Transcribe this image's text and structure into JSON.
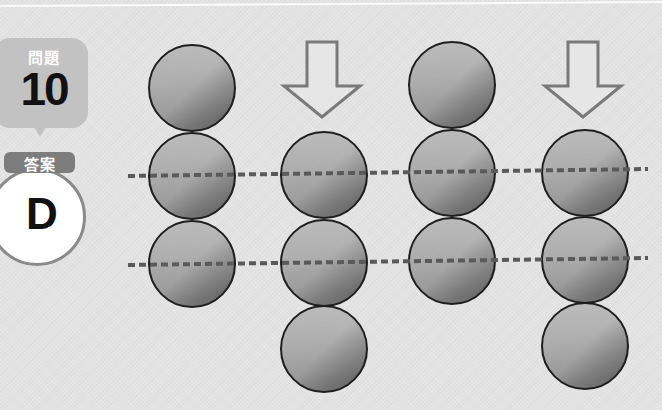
{
  "question": {
    "label": "問題",
    "number": "10"
  },
  "answer": {
    "label": "答案",
    "value": "D"
  },
  "diagram": {
    "columns": [
      {
        "index": 1,
        "arrow": false,
        "spheres_y": [
          88,
          176,
          264
        ],
        "x": 192
      },
      {
        "index": 2,
        "arrow": true,
        "spheres_y": [
          175,
          263,
          349
        ],
        "x": 324
      },
      {
        "index": 3,
        "arrow": false,
        "spheres_y": [
          85,
          173,
          261
        ],
        "x": 452
      },
      {
        "index": 4,
        "arrow": true,
        "spheres_y": [
          173,
          260,
          346
        ],
        "x": 585
      }
    ],
    "sphere_radius": 43,
    "dashed_lines": [
      {
        "x1": 128,
        "y1": 176,
        "x2": 648,
        "y2": 169
      },
      {
        "x1": 128,
        "y1": 265,
        "x2": 648,
        "y2": 258
      }
    ],
    "colors": {
      "background": "#e3e3e3",
      "sphere_light": "#b9b9b9",
      "sphere_dark": "#6f6f6f",
      "sphere_outline": "#1e1e1e",
      "dash": "#5a5a5a",
      "arrow_stroke": "#7a7a7a",
      "arrow_fill": "#e6e6e6",
      "question_badge": "#c2c2c2",
      "answer_tag": "#7d7d7d",
      "answer_ring": "#8a8a8a"
    }
  }
}
